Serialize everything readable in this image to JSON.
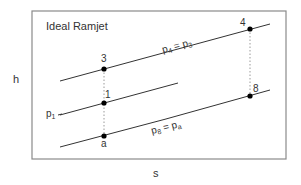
{
  "title": "Ideal Ramjet",
  "axes": {
    "y_label": "h",
    "x_label": "s"
  },
  "points": {
    "p3": {
      "label": "3"
    },
    "p1": {
      "label": "1"
    },
    "pa": {
      "label": "a"
    },
    "p4": {
      "label": "4"
    },
    "p8": {
      "label": "8"
    }
  },
  "isobars": {
    "top": {
      "label": "p",
      "sub1": "4",
      "eq": " = p",
      "sub2": "3"
    },
    "middle": {
      "label": "p",
      "sub1": "1"
    },
    "bottom": {
      "label": "p",
      "sub1": "8",
      "eq": " = p",
      "sub2": "a"
    }
  },
  "colors": {
    "line": "#333333",
    "frame": "#8a8a8a",
    "dotted": "#9a9a9a",
    "point": "#000000"
  }
}
